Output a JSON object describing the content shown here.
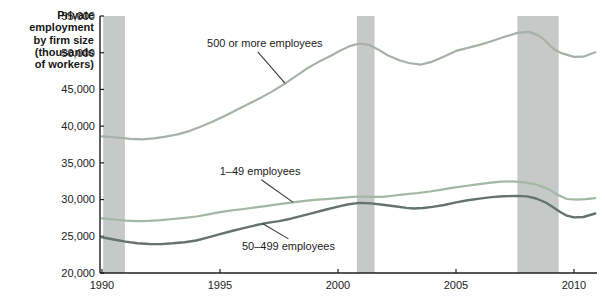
{
  "figure": {
    "y_axis_label": "Private\nemployment\nby firm size\n(thousands\nof workers)"
  },
  "chart_data": {
    "type": "line",
    "title": "Private employment by firm size (thousands of workers)",
    "xlabel": "",
    "ylabel": "Private employment by firm size (thousands of workers)",
    "x_range": [
      1989.9,
      2011.0
    ],
    "y_range": [
      20000,
      55000
    ],
    "x_ticks": [
      1990,
      1995,
      2000,
      2005,
      2010
    ],
    "y_ticks": [
      {
        "value": 20000,
        "label": "20,000"
      },
      {
        "value": 25000,
        "label": "25,000"
      },
      {
        "value": 30000,
        "label": "30,000"
      },
      {
        "value": 35000,
        "label": "35,000"
      },
      {
        "value": 40000,
        "label": "40,000"
      },
      {
        "value": 45000,
        "label": "45,000"
      },
      {
        "value": 50000,
        "label": "50,000"
      },
      {
        "value": 55000,
        "label": "55,000"
      }
    ],
    "grid": false,
    "legend_position": "inline-annotations",
    "band_color": "#c6c9c7",
    "axis_color": "#1e1e1e",
    "recession_bands": [
      [
        1990.05,
        1990.97
      ],
      [
        2000.8,
        2001.55
      ],
      [
        2007.6,
        2009.35
      ]
    ],
    "series": [
      {
        "id": "s500plus",
        "label": "500 or more employees",
        "color": "#a7b1a8",
        "width": 2.2,
        "points": [
          [
            1990.0,
            38600
          ],
          [
            1990.4,
            38520
          ],
          [
            1990.8,
            38400
          ],
          [
            1991.2,
            38260
          ],
          [
            1991.7,
            38200
          ],
          [
            1992.2,
            38350
          ],
          [
            1992.7,
            38560
          ],
          [
            1993.2,
            38870
          ],
          [
            1993.7,
            39320
          ],
          [
            1994.2,
            39950
          ],
          [
            1994.7,
            40620
          ],
          [
            1995.2,
            41400
          ],
          [
            1995.7,
            42180
          ],
          [
            1996.2,
            43000
          ],
          [
            1996.7,
            43820
          ],
          [
            1997.2,
            44700
          ],
          [
            1997.7,
            45680
          ],
          [
            1998.2,
            46780
          ],
          [
            1998.7,
            47880
          ],
          [
            1999.2,
            48790
          ],
          [
            1999.7,
            49600
          ],
          [
            2000.1,
            50300
          ],
          [
            2000.5,
            50900
          ],
          [
            2000.9,
            51250
          ],
          [
            2001.3,
            51080
          ],
          [
            2001.7,
            50450
          ],
          [
            2002.1,
            49650
          ],
          [
            2002.6,
            48970
          ],
          [
            2003.0,
            48600
          ],
          [
            2003.5,
            48370
          ],
          [
            2004.0,
            48790
          ],
          [
            2004.5,
            49500
          ],
          [
            2005.0,
            50250
          ],
          [
            2005.5,
            50650
          ],
          [
            2006.0,
            51060
          ],
          [
            2006.5,
            51550
          ],
          [
            2007.0,
            52100
          ],
          [
            2007.6,
            52700
          ],
          [
            2008.1,
            52830
          ],
          [
            2008.5,
            52350
          ],
          [
            2008.8,
            51600
          ],
          [
            2009.0,
            50900
          ],
          [
            2009.2,
            50380
          ],
          [
            2009.5,
            49900
          ],
          [
            2010.0,
            49430
          ],
          [
            2010.4,
            49460
          ],
          [
            2010.9,
            50050
          ]
        ]
      },
      {
        "id": "s1to49",
        "label": "1–49 employees",
        "color": "#a3b8a3",
        "width": 2.2,
        "points": [
          [
            1990.0,
            27450
          ],
          [
            1990.5,
            27280
          ],
          [
            1991.0,
            27130
          ],
          [
            1991.5,
            27070
          ],
          [
            1992.0,
            27090
          ],
          [
            1992.5,
            27200
          ],
          [
            1993.0,
            27360
          ],
          [
            1993.5,
            27510
          ],
          [
            1994.0,
            27700
          ],
          [
            1994.5,
            28000
          ],
          [
            1995.0,
            28300
          ],
          [
            1995.5,
            28520
          ],
          [
            1996.0,
            28720
          ],
          [
            1996.5,
            28950
          ],
          [
            1997.0,
            29150
          ],
          [
            1997.5,
            29380
          ],
          [
            1998.0,
            29580
          ],
          [
            1998.5,
            29780
          ],
          [
            1999.0,
            29950
          ],
          [
            1999.5,
            30070
          ],
          [
            2000.0,
            30190
          ],
          [
            2000.5,
            30330
          ],
          [
            2000.9,
            30420
          ],
          [
            2001.4,
            30380
          ],
          [
            2001.9,
            30360
          ],
          [
            2002.4,
            30550
          ],
          [
            2002.9,
            30750
          ],
          [
            2003.4,
            30900
          ],
          [
            2003.9,
            31100
          ],
          [
            2004.4,
            31350
          ],
          [
            2004.9,
            31620
          ],
          [
            2005.4,
            31850
          ],
          [
            2005.9,
            32080
          ],
          [
            2006.4,
            32280
          ],
          [
            2006.9,
            32440
          ],
          [
            2007.4,
            32480
          ],
          [
            2007.9,
            32350
          ],
          [
            2008.4,
            32050
          ],
          [
            2008.9,
            31450
          ],
          [
            2009.3,
            30650
          ],
          [
            2009.7,
            30080
          ],
          [
            2010.1,
            29980
          ],
          [
            2010.5,
            30060
          ],
          [
            2010.9,
            30180
          ]
        ]
      },
      {
        "id": "s50to499",
        "label": "50–499 employees",
        "color": "#64746a",
        "width": 2.4,
        "points": [
          [
            1990.0,
            24860
          ],
          [
            1990.5,
            24560
          ],
          [
            1991.0,
            24270
          ],
          [
            1991.5,
            24060
          ],
          [
            1992.0,
            23950
          ],
          [
            1992.5,
            23930
          ],
          [
            1993.0,
            24050
          ],
          [
            1993.5,
            24200
          ],
          [
            1994.0,
            24420
          ],
          [
            1994.5,
            24850
          ],
          [
            1995.0,
            25300
          ],
          [
            1995.5,
            25720
          ],
          [
            1996.0,
            26120
          ],
          [
            1996.5,
            26500
          ],
          [
            1997.0,
            26820
          ],
          [
            1997.5,
            27070
          ],
          [
            1998.0,
            27400
          ],
          [
            1998.5,
            27810
          ],
          [
            1999.0,
            28220
          ],
          [
            1999.5,
            28650
          ],
          [
            2000.0,
            29040
          ],
          [
            2000.4,
            29330
          ],
          [
            2000.9,
            29550
          ],
          [
            2001.4,
            29480
          ],
          [
            2001.9,
            29300
          ],
          [
            2002.4,
            29080
          ],
          [
            2002.9,
            28870
          ],
          [
            2003.2,
            28790
          ],
          [
            2003.6,
            28850
          ],
          [
            2004.0,
            29000
          ],
          [
            2004.5,
            29260
          ],
          [
            2005.0,
            29620
          ],
          [
            2005.5,
            29910
          ],
          [
            2006.0,
            30130
          ],
          [
            2006.5,
            30330
          ],
          [
            2007.0,
            30450
          ],
          [
            2007.6,
            30500
          ],
          [
            2008.0,
            30430
          ],
          [
            2008.4,
            30150
          ],
          [
            2008.8,
            29600
          ],
          [
            2009.1,
            29000
          ],
          [
            2009.4,
            28350
          ],
          [
            2009.7,
            27800
          ],
          [
            2010.0,
            27570
          ],
          [
            2010.4,
            27630
          ],
          [
            2010.9,
            28100
          ]
        ]
      }
    ],
    "annotations": [
      {
        "series": 0,
        "label_anchor": [
          1996.9,
          51340
        ],
        "arrow": [
          [
            1996.6,
            50100
          ],
          [
            1997.75,
            45850
          ]
        ]
      },
      {
        "series": 1,
        "label_anchor": [
          1996.7,
          33900
        ],
        "arrow": [
          [
            1996.75,
            32700
          ],
          [
            1998.1,
            29620
          ]
        ]
      },
      {
        "series": 2,
        "label_anchor": [
          1997.9,
          23680
        ],
        "arrow": [
          [
            1997.9,
            24650
          ],
          [
            1996.8,
            26740
          ]
        ]
      }
    ]
  }
}
